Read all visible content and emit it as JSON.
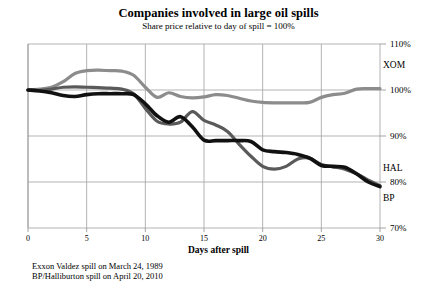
{
  "chart_data": {
    "type": "line",
    "title": "Companies involved in large oil spills",
    "subtitle": "Share price relative to day of spill = 100%",
    "xlabel": "Days after spill",
    "ylabel": "",
    "xlim": [
      0,
      30
    ],
    "ylim": [
      70,
      110
    ],
    "grid": true,
    "legend_position": "right-inline",
    "xticks": [
      "0",
      "5",
      "10",
      "15",
      "20",
      "25",
      "30"
    ],
    "xtick_values": [
      0,
      5,
      10,
      15,
      20,
      25,
      30
    ],
    "yticks": [
      "110%",
      "100%",
      "90%",
      "80%",
      "70%"
    ],
    "ytick_values": [
      110,
      100,
      90,
      80,
      70
    ],
    "x": [
      0,
      1,
      2,
      3,
      4,
      5,
      6,
      7,
      8,
      9,
      10,
      11,
      12,
      13,
      14,
      15,
      16,
      17,
      18,
      19,
      20,
      21,
      22,
      23,
      24,
      25,
      26,
      27,
      28,
      29,
      30
    ],
    "series": [
      {
        "name": "XOM",
        "color": "#8c8c8c",
        "width": 3.2,
        "values": [
          100.0,
          100.2,
          100.6,
          101.8,
          103.6,
          104.2,
          104.3,
          104.2,
          104.1,
          103.2,
          100.6,
          98.4,
          99.4,
          98.6,
          98.3,
          98.5,
          99.0,
          98.8,
          98.2,
          97.6,
          97.3,
          97.2,
          97.2,
          97.2,
          97.3,
          98.4,
          99.0,
          99.3,
          100.2,
          100.3,
          100.3
        ]
      },
      {
        "name": "HAL",
        "color": "#5a5a5a",
        "width": 3.2,
        "values": [
          100.0,
          99.9,
          100.2,
          100.6,
          100.7,
          100.6,
          100.5,
          100.4,
          100.2,
          99.2,
          96.0,
          93.2,
          92.6,
          93.0,
          95.3,
          93.4,
          92.4,
          91.0,
          88.2,
          85.6,
          83.4,
          82.8,
          83.4,
          85.0,
          85.2,
          83.8,
          83.3,
          82.8,
          81.8,
          80.4,
          79.2
        ]
      },
      {
        "name": "BP",
        "color": "#111111",
        "width": 3.6,
        "values": [
          100.0,
          99.8,
          99.4,
          98.8,
          98.6,
          99.0,
          99.2,
          99.2,
          99.2,
          99.0,
          97.0,
          94.4,
          93.0,
          94.2,
          92.0,
          89.1,
          89.0,
          89.0,
          89.0,
          88.8,
          87.0,
          86.6,
          86.4,
          86.0,
          85.2,
          83.6,
          83.4,
          83.2,
          81.8,
          80.0,
          79.0
        ]
      }
    ],
    "series_labels": [
      {
        "name": "XOM",
        "x": 383,
        "y": 60
      },
      {
        "name": "HAL",
        "x": 383,
        "y": 163
      },
      {
        "name": "BP",
        "x": 383,
        "y": 193
      }
    ],
    "footnotes": [
      "Exxon Valdez spill on March 24, 1989",
      "BP/Halliburton spill on April 20, 2010"
    ],
    "axis_color": "#999999",
    "grid_color": "#aaaaaa"
  }
}
